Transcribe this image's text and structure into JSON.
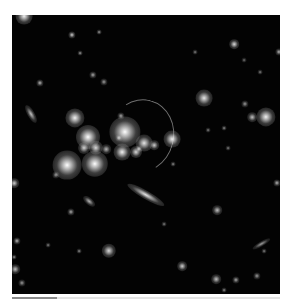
{
  "image": {
    "subject": "galaxy cluster with gravitational lensing arc",
    "background_color": "#030303"
  },
  "objects": [
    {
      "x": 12,
      "y": 1,
      "r": 7,
      "b": 0.95
    },
    {
      "x": 60,
      "y": 20,
      "r": 3,
      "b": 0.8
    },
    {
      "x": 87,
      "y": 17,
      "r": 2,
      "b": 0.6
    },
    {
      "x": 68,
      "y": 38,
      "r": 2,
      "b": 0.6
    },
    {
      "x": 222,
      "y": 29,
      "r": 4,
      "b": 0.85
    },
    {
      "x": 267,
      "y": 37,
      "r": 3,
      "b": 0.7
    },
    {
      "x": 183,
      "y": 37,
      "r": 2,
      "b": 0.5
    },
    {
      "x": 232,
      "y": 45,
      "r": 2,
      "b": 0.45
    },
    {
      "x": 248,
      "y": 57,
      "r": 2,
      "b": 0.5
    },
    {
      "x": 28,
      "y": 68,
      "r": 3,
      "b": 0.7
    },
    {
      "x": 81,
      "y": 60,
      "r": 3,
      "b": 0.65
    },
    {
      "x": 92,
      "y": 67,
      "r": 3,
      "b": 0.6
    },
    {
      "x": 19,
      "y": 99,
      "r": 5,
      "b": 0.75,
      "sx": 0.6,
      "rot": 60
    },
    {
      "x": 63,
      "y": 103,
      "r": 8,
      "b": 0.95
    },
    {
      "x": 192,
      "y": 83,
      "r": 7,
      "b": 0.9
    },
    {
      "x": 233,
      "y": 89,
      "r": 3,
      "b": 0.6
    },
    {
      "x": 240,
      "y": 102,
      "r": 4,
      "b": 0.75
    },
    {
      "x": 254,
      "y": 102,
      "r": 8,
      "b": 0.95
    },
    {
      "x": 212,
      "y": 113,
      "r": 2,
      "b": 0.55
    },
    {
      "x": 76,
      "y": 122,
      "r": 10,
      "b": 1.0
    },
    {
      "x": 72,
      "y": 133,
      "r": 5,
      "b": 0.8
    },
    {
      "x": 84,
      "y": 133,
      "r": 6,
      "b": 0.85
    },
    {
      "x": 94,
      "y": 134,
      "r": 4,
      "b": 0.7
    },
    {
      "x": 55,
      "y": 150,
      "r": 12,
      "b": 1.0
    },
    {
      "x": 83,
      "y": 149,
      "r": 11,
      "b": 1.0
    },
    {
      "x": 44,
      "y": 160,
      "r": 3,
      "b": 0.6
    },
    {
      "x": 113,
      "y": 117,
      "r": 13,
      "b": 1.0
    },
    {
      "x": 107,
      "y": 123,
      "r": 3,
      "b": 0.7
    },
    {
      "x": 109,
      "y": 101,
      "r": 3,
      "b": 0.65
    },
    {
      "x": 132,
      "y": 128,
      "r": 7,
      "b": 0.9
    },
    {
      "x": 142,
      "y": 130,
      "r": 4,
      "b": 0.8
    },
    {
      "x": 110,
      "y": 137,
      "r": 7,
      "b": 0.95
    },
    {
      "x": 124,
      "y": 137,
      "r": 5,
      "b": 0.85
    },
    {
      "x": 127,
      "y": 134,
      "r": 3,
      "b": 0.75
    },
    {
      "x": 160,
      "y": 124,
      "r": 7,
      "b": 0.95
    },
    {
      "x": 161,
      "y": 149,
      "r": 2,
      "b": 0.55
    },
    {
      "x": 216,
      "y": 133,
      "r": 2,
      "b": 0.5
    },
    {
      "x": 196,
      "y": 115,
      "r": 2,
      "b": 0.5
    },
    {
      "x": 2,
      "y": 168,
      "r": 4,
      "b": 0.8
    },
    {
      "x": 265,
      "y": 168,
      "r": 3,
      "b": 0.7
    },
    {
      "x": 134,
      "y": 180,
      "r": 8,
      "b": 0.9,
      "sx": 0.45,
      "rot": 30
    },
    {
      "x": 77,
      "y": 186,
      "r": 4,
      "b": 0.7,
      "sx": 0.7,
      "rot": 40
    },
    {
      "x": 59,
      "y": 197,
      "r": 3,
      "b": 0.65
    },
    {
      "x": 205,
      "y": 195,
      "r": 4,
      "b": 0.75
    },
    {
      "x": 152,
      "y": 209,
      "r": 2,
      "b": 0.5
    },
    {
      "x": 97,
      "y": 236,
      "r": 6,
      "b": 0.85
    },
    {
      "x": 67,
      "y": 236,
      "r": 2,
      "b": 0.55
    },
    {
      "x": 5,
      "y": 226,
      "r": 3,
      "b": 0.7
    },
    {
      "x": 36,
      "y": 230,
      "r": 2,
      "b": 0.5
    },
    {
      "x": 2,
      "y": 242,
      "r": 2,
      "b": 0.55
    },
    {
      "x": 3,
      "y": 254,
      "r": 4,
      "b": 0.75
    },
    {
      "x": 249,
      "y": 229,
      "r": 4,
      "b": 0.6,
      "sx": 0.5,
      "rot": -30
    },
    {
      "x": 252,
      "y": 236,
      "r": 2,
      "b": 0.5
    },
    {
      "x": 170,
      "y": 251,
      "r": 4,
      "b": 0.8
    },
    {
      "x": 204,
      "y": 264,
      "r": 4,
      "b": 0.75
    },
    {
      "x": 224,
      "y": 265,
      "r": 3,
      "b": 0.65
    },
    {
      "x": 245,
      "y": 261,
      "r": 3,
      "b": 0.6
    },
    {
      "x": 10,
      "y": 268,
      "r": 3,
      "b": 0.6
    },
    {
      "x": 212,
      "y": 275,
      "r": 2,
      "b": 0.55
    }
  ],
  "arc": {
    "x": 96,
    "y": 84,
    "w": 64,
    "h": 72
  },
  "progress_bar": {
    "percent": 17
  }
}
